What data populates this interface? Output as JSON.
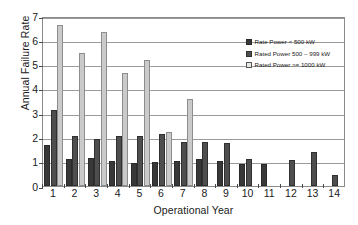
{
  "chart_data": {
    "type": "bar",
    "title": "",
    "xlabel": "Operational Year",
    "ylabel": "Annual Failure Rate",
    "categories": [
      "1",
      "2",
      "3",
      "4",
      "5",
      "6",
      "7",
      "8",
      "9",
      "10",
      "11",
      "12",
      "13",
      "14"
    ],
    "ylim": [
      0,
      7
    ],
    "yticks": [
      0,
      1,
      2,
      3,
      4,
      5,
      6,
      7
    ],
    "ytick_labels": [
      "0",
      "1",
      "2",
      "3",
      "4",
      "5",
      "6",
      "7"
    ],
    "grid": true,
    "legend_position": "top-right-inside",
    "series": [
      {
        "name": "Rate Power < 500 kW",
        "color": "#383838",
        "values": [
          1.65,
          1.1,
          1.12,
          1.02,
          0.92,
          0.97,
          1.0,
          1.1,
          1.02,
          0.88,
          0.9,
          null,
          null,
          null
        ]
      },
      {
        "name": "Rated Power 500 – 999 kW",
        "color": "#4e4e4e",
        "values": [
          3.1,
          2.03,
          1.9,
          2.04,
          2.02,
          2.12,
          1.8,
          1.81,
          1.74,
          1.08,
          null,
          1.05,
          1.38,
          0.42
        ]
      },
      {
        "name": "Rated Power >= 1000 kW",
        "color": "#cacaca",
        "values": [
          6.62,
          5.44,
          6.34,
          4.64,
          5.18,
          2.22,
          3.57,
          null,
          null,
          null,
          null,
          null,
          null,
          null
        ]
      }
    ]
  },
  "axes": {
    "y_title": "Annual Failure Rate",
    "x_title": "Operational Year"
  },
  "legend": {
    "items": [
      {
        "label": "Rate Power < 500 kW",
        "swatch": "dark"
      },
      {
        "label": "Rated Power 500 – 999 kW",
        "swatch": "medium"
      },
      {
        "label": "Rated Power >= 1000 kW",
        "swatch": "light"
      }
    ]
  }
}
